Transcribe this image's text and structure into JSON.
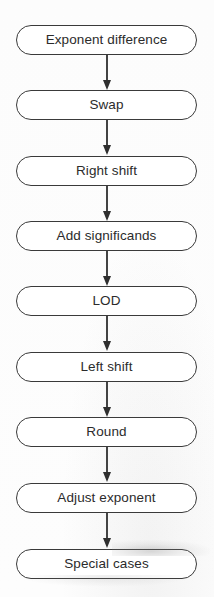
{
  "diagram": {
    "orientation": "vertical-top-down",
    "node_shape": "rounded-pill",
    "colors": {
      "background": "#fdfdfd",
      "node_fill": "#ffffff",
      "node_border": "#3a3a3a",
      "text": "#2b2b2b",
      "arrow": "#2f2f2f"
    },
    "nodes": [
      {
        "id": "exponent-difference",
        "label": "Exponent difference"
      },
      {
        "id": "swap",
        "label": "Swap"
      },
      {
        "id": "right-shift",
        "label": "Right shift"
      },
      {
        "id": "add-significands",
        "label": "Add significands"
      },
      {
        "id": "lod",
        "label": "LOD"
      },
      {
        "id": "left-shift",
        "label": "Left shift"
      },
      {
        "id": "round",
        "label": "Round"
      },
      {
        "id": "adjust-exponent",
        "label": "Adjust exponent"
      },
      {
        "id": "special-cases",
        "label": "Special cases"
      }
    ],
    "edges": [
      {
        "from": "exponent-difference",
        "to": "swap",
        "style": "arrow-down"
      },
      {
        "from": "swap",
        "to": "right-shift",
        "style": "arrow-down"
      },
      {
        "from": "right-shift",
        "to": "add-significands",
        "style": "arrow-down"
      },
      {
        "from": "add-significands",
        "to": "lod",
        "style": "arrow-down"
      },
      {
        "from": "lod",
        "to": "left-shift",
        "style": "arrow-down"
      },
      {
        "from": "left-shift",
        "to": "round",
        "style": "arrow-down"
      },
      {
        "from": "round",
        "to": "adjust-exponent",
        "style": "arrow-down"
      },
      {
        "from": "adjust-exponent",
        "to": "special-cases",
        "style": "arrow-down"
      }
    ]
  }
}
